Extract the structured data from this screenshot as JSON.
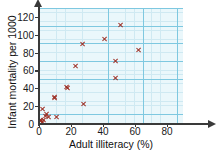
{
  "chart_data": {
    "type": "scatter",
    "title": "",
    "xlabel": "Adult illiteracy (%)",
    "ylabel": "Infant mortality per 1000",
    "xlim": [
      0,
      90
    ],
    "ylim": [
      0,
      130
    ],
    "xticks": [
      0,
      20,
      40,
      60,
      80
    ],
    "yticks": [
      0,
      20,
      40,
      60,
      80,
      100,
      120
    ],
    "grid": true,
    "grid_major_step_x": 20,
    "grid_major_step_y": 20,
    "grid_minor_step_x": 5,
    "grid_minor_step_y": 5,
    "legend": null,
    "marker": "x",
    "marker_color": "#9c2b20",
    "plot_background": "#eaf7fb",
    "grid_color_major": "#7ec8e0",
    "grid_color_minor": "#cfe9f2",
    "axis_color": "#3a3a3a",
    "points": [
      {
        "x": 1,
        "y": 3
      },
      {
        "x": 1,
        "y": 5
      },
      {
        "x": 2,
        "y": 2
      },
      {
        "x": 2,
        "y": 17
      },
      {
        "x": 3,
        "y": 4
      },
      {
        "x": 4,
        "y": 9
      },
      {
        "x": 5,
        "y": 11
      },
      {
        "x": 6,
        "y": 8
      },
      {
        "x": 10,
        "y": 30
      },
      {
        "x": 10,
        "y": 29
      },
      {
        "x": 11,
        "y": 8
      },
      {
        "x": 17,
        "y": 41
      },
      {
        "x": 18,
        "y": 40
      },
      {
        "x": 23,
        "y": 65
      },
      {
        "x": 27,
        "y": 90
      },
      {
        "x": 28,
        "y": 22
      },
      {
        "x": 41,
        "y": 95
      },
      {
        "x": 48,
        "y": 51
      },
      {
        "x": 48,
        "y": 71
      },
      {
        "x": 51,
        "y": 111
      },
      {
        "x": 62,
        "y": 83
      }
    ]
  },
  "axis": {
    "x_tick_labels": [
      "0",
      "20",
      "40",
      "60",
      "80"
    ],
    "y_tick_labels": [
      "0",
      "20",
      "40",
      "60",
      "80",
      "100",
      "120"
    ]
  }
}
